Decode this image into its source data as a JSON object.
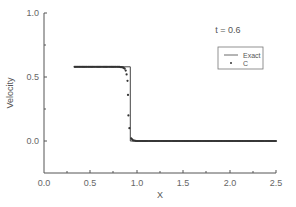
{
  "chart_data": {
    "type": "line",
    "title": "",
    "annotation": "t = 0.6",
    "xlabel": "X",
    "ylabel": "Velocity",
    "xlim": [
      0.0,
      2.5
    ],
    "ylim": [
      -0.25,
      1.0
    ],
    "x_ticks": [
      "0.0",
      "0.5",
      "1.0",
      "1.5",
      "2.0",
      "2.5"
    ],
    "y_ticks": [
      "0.0",
      "0.5",
      "1.0"
    ],
    "grid": false,
    "legend_position": "upper right",
    "series": [
      {
        "name": "Exact",
        "style": "line",
        "x": [
          0.33,
          0.93,
          0.93,
          2.5
        ],
        "y": [
          0.58,
          0.58,
          0.0,
          0.0
        ]
      },
      {
        "name": "C",
        "style": "markers",
        "x": [
          0.33,
          0.4,
          0.5,
          0.6,
          0.7,
          0.8,
          0.85,
          0.87,
          0.88,
          0.89,
          0.9,
          0.905,
          0.91,
          0.92,
          0.94,
          0.96,
          1.0,
          1.25,
          1.5,
          1.75,
          2.0,
          2.25,
          2.5
        ],
        "y": [
          0.58,
          0.58,
          0.58,
          0.58,
          0.58,
          0.58,
          0.575,
          0.565,
          0.55,
          0.52,
          0.47,
          0.36,
          0.2,
          0.1,
          0.02,
          0.005,
          0.0,
          0.0,
          0.0,
          0.0,
          0.0,
          0.0,
          0.0
        ]
      }
    ]
  },
  "legend": {
    "exact_label": "Exact",
    "c_label": "C"
  },
  "labels": {
    "annotation": "t = 0.6",
    "xlabel": "X",
    "ylabel": "Velocity",
    "x_ticks": [
      "0.0",
      "0.5",
      "1.0",
      "1.5",
      "2.0",
      "2.5"
    ],
    "y_ticks": [
      "0.0",
      "0.5",
      "1.0"
    ]
  },
  "colors": {
    "axis": "#555555",
    "line": "#444444",
    "marker": "#333333",
    "text": "#666666"
  }
}
